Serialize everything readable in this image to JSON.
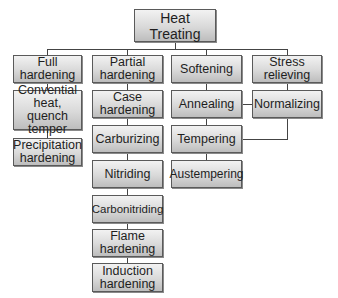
{
  "diagram": {
    "root": "Heat\nTreating",
    "columns": [
      {
        "header": "Full\nhardening",
        "items": [
          "Convential\nheat, quench\ntemper",
          "Precipitation\nhardening"
        ]
      },
      {
        "header": "Partial\nhardening",
        "items": [
          "Case\nhardening",
          "Carburizing",
          "Nitriding",
          "Carbonitriding",
          "Flame\nhardening",
          "Induction\nhardening"
        ]
      },
      {
        "header": "Softening",
        "items": [
          "Annealing",
          "Tempering",
          "Austempering"
        ]
      },
      {
        "header": "Stress\nrelieving",
        "items": [
          "Normalizing"
        ]
      }
    ],
    "cross_links": [
      {
        "from": "Annealing",
        "to": "Normalizing"
      },
      {
        "from": "Tempering",
        "to": "Normalizing"
      }
    ]
  }
}
